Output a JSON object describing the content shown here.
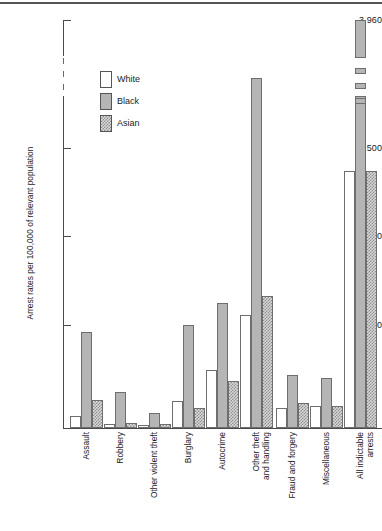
{
  "chart_data": {
    "type": "bar",
    "title": "",
    "subtitle": "",
    "xlabel": "",
    "ylabel": "Arrest rates per 100,000 of relevant population",
    "ylim": [
      0,
      3960
    ],
    "y_ticks": [
      {
        "value": 500,
        "label": "500"
      },
      {
        "value": 1000,
        "label": "1,000"
      },
      {
        "value": 1500,
        "label": "1,500"
      },
      {
        "value": 3960,
        "label": "3,960"
      }
    ],
    "axis_break": {
      "present": true,
      "between": [
        1800,
        3700
      ],
      "style": "dashed"
    },
    "grid": false,
    "legend_position": "top-left-inside",
    "categories": [
      "Assault",
      "Robbery",
      "Other violent theft",
      "Burglary",
      "Autocrime",
      "Other theft and handling",
      "Fraud and forgery",
      "Miscellaneous",
      "All indictable arrests"
    ],
    "category_lines": [
      [
        "Assault"
      ],
      [
        "Robbery"
      ],
      [
        "Other violent theft"
      ],
      [
        "Burglary"
      ],
      [
        "Autocrime"
      ],
      [
        "Other theft",
        "and handling"
      ],
      [
        "Fraud and forgery"
      ],
      [
        "Miscellaneous"
      ],
      [
        "All indictable",
        "arrests"
      ]
    ],
    "series": [
      {
        "name": "White",
        "fill": "white",
        "values": [
          60,
          20,
          15,
          130,
          280,
          550,
          95,
          105,
          1250
        ]
      },
      {
        "name": "Black",
        "fill": "black",
        "values": [
          465,
          175,
          75,
          500,
          605,
          1700,
          255,
          245,
          3960
        ]
      },
      {
        "name": "Asian",
        "fill": "asian",
        "values": [
          135,
          25,
          18,
          95,
          230,
          640,
          120,
          105,
          1250
        ]
      }
    ]
  },
  "legend": {
    "items": [
      {
        "label": "White",
        "swatch": "white-swatch"
      },
      {
        "label": "Black",
        "swatch": "black-swatch"
      },
      {
        "label": "Asian",
        "swatch": "asian-swatch"
      }
    ]
  },
  "axis": {
    "y_title": "Arrest rates per 100,000 of relevant population",
    "tick_labels": [
      "3,960",
      "1,500",
      "1,000",
      "500"
    ]
  },
  "colors": {
    "white_fill": "#ffffff",
    "black_fill": "#b5b5b5",
    "asian_fill": "#d8d8d8",
    "outline": "#6e6e6e",
    "axis": "#4a4a4a",
    "text": "#1a1a1a",
    "top_rule": "#555555"
  }
}
